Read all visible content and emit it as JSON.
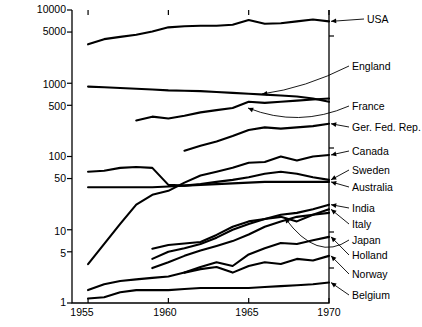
{
  "chart_data": {
    "type": "line",
    "title": "",
    "subtitle": "",
    "xlabel": "",
    "ylabel": "",
    "scale": "log-y",
    "grid": false,
    "legend_position": "right-inline-labels",
    "xlim": [
      1954,
      1970
    ],
    "ylim": [
      1,
      10000
    ],
    "x_ticks": [
      1955,
      1960,
      1965,
      1970
    ],
    "x_tick_labels": [
      "1955",
      "1960",
      "1965",
      "1970"
    ],
    "y_ticks": [
      1,
      5,
      10,
      50,
      100,
      500,
      1000,
      5000,
      10000
    ],
    "y_tick_labels": [
      "1",
      "5",
      "10",
      "50",
      "100",
      "500",
      "1000",
      "5000",
      "10000"
    ],
    "series": [
      {
        "name": "USA",
        "label": "USA",
        "x": [
          1955,
          1956,
          1957,
          1958,
          1959,
          1960,
          1961,
          1962,
          1963,
          1964,
          1965,
          1966,
          1967,
          1968,
          1969,
          1970
        ],
        "values": [
          3400,
          4000,
          4300,
          4600,
          5100,
          5800,
          6000,
          6100,
          6100,
          6300,
          7300,
          6500,
          6600,
          7000,
          7400,
          7000
        ]
      },
      {
        "name": "England",
        "label": "England",
        "x": [
          1955,
          1956,
          1957,
          1958,
          1959,
          1960,
          1961,
          1962,
          1963,
          1964,
          1965,
          1966,
          1967,
          1968,
          1969,
          1970
        ],
        "values": [
          900,
          880,
          860,
          840,
          820,
          800,
          790,
          780,
          760,
          740,
          720,
          700,
          680,
          660,
          620,
          560
        ]
      },
      {
        "name": "France",
        "label": "France",
        "x": [
          1958,
          1959,
          1960,
          1961,
          1962,
          1963,
          1964,
          1965,
          1966,
          1967,
          1968,
          1969,
          1970
        ],
        "values": [
          310,
          350,
          330,
          360,
          400,
          430,
          460,
          560,
          540,
          560,
          580,
          600,
          620
        ]
      },
      {
        "name": "Ger. Fed. Rep.",
        "label": "Ger. Fed. Rep.",
        "x": [
          1961,
          1962,
          1963,
          1964,
          1965,
          1966,
          1967,
          1968,
          1969,
          1970
        ],
        "values": [
          120,
          140,
          160,
          190,
          230,
          250,
          240,
          250,
          260,
          280
        ]
      },
      {
        "name": "Canada",
        "label": "Canada",
        "x": [
          1955,
          1957,
          1958,
          1959,
          1960,
          1961,
          1962,
          1963,
          1964,
          1965,
          1966,
          1967,
          1968,
          1969,
          1970
        ],
        "values": [
          3.4,
          12,
          22,
          30,
          34,
          44,
          55,
          62,
          70,
          82,
          84,
          100,
          88,
          100,
          105
        ]
      },
      {
        "name": "Sweden",
        "label": "Sweden",
        "x": [
          1955,
          1956,
          1957,
          1958,
          1959,
          1960,
          1961,
          1962,
          1963,
          1964,
          1965,
          1966,
          1967,
          1968,
          1969,
          1970
        ],
        "values": [
          62,
          64,
          70,
          72,
          70,
          41,
          40,
          42,
          45,
          48,
          52,
          58,
          62,
          58,
          52,
          48
        ]
      },
      {
        "name": "Australia",
        "label": "Australia",
        "x": [
          1955,
          1956,
          1957,
          1958,
          1959,
          1960,
          1961,
          1962,
          1963,
          1964,
          1965,
          1966,
          1967,
          1968,
          1969,
          1970
        ],
        "values": [
          38,
          38,
          38,
          38,
          38,
          39,
          40,
          41,
          42,
          43,
          44,
          45,
          45,
          45,
          45,
          45
        ]
      },
      {
        "name": "India",
        "label": "India",
        "x": [
          1959,
          1960,
          1961,
          1962,
          1963,
          1964,
          1965,
          1966,
          1967,
          1968,
          1969,
          1970
        ],
        "values": [
          5.5,
          6.2,
          6.5,
          6.8,
          8.5,
          11,
          13,
          14,
          16,
          17,
          19,
          22
        ]
      },
      {
        "name": "Italy",
        "label": "Italy",
        "x": [
          1959,
          1960,
          1961,
          1962,
          1963,
          1964,
          1965,
          1966,
          1967,
          1968,
          1969,
          1970
        ],
        "values": [
          4.0,
          5.0,
          5.6,
          6.4,
          7.8,
          10,
          12,
          14,
          15,
          13,
          16,
          19
        ]
      },
      {
        "name": "Japan",
        "label": "Japan",
        "x": [
          1959,
          1960,
          1961,
          1962,
          1963,
          1964,
          1965,
          1966,
          1967,
          1968,
          1969,
          1970
        ],
        "values": [
          3.0,
          3.6,
          4.4,
          5.2,
          6.0,
          7.0,
          8.6,
          11,
          13,
          15,
          16,
          17
        ]
      },
      {
        "name": "Holland",
        "label": "Holland",
        "x": [
          1961,
          1962,
          1963,
          1964,
          1965,
          1966,
          1967,
          1968,
          1969,
          1970
        ],
        "values": [
          2.6,
          3.1,
          3.6,
          3.2,
          4.6,
          5.6,
          6.6,
          6.4,
          7.2,
          8.0
        ]
      },
      {
        "name": "Norway",
        "label": "Norway",
        "x": [
          1955,
          1956,
          1957,
          1958,
          1959,
          1960,
          1961,
          1962,
          1963,
          1964,
          1965,
          1966,
          1967,
          1968,
          1969,
          1970
        ],
        "values": [
          1.5,
          1.8,
          2.0,
          2.1,
          2.2,
          2.3,
          2.6,
          2.9,
          3.1,
          2.6,
          3.2,
          3.6,
          3.4,
          4.0,
          3.8,
          4.4
        ]
      },
      {
        "name": "Belgium",
        "label": "Belgium",
        "x": [
          1955,
          1956,
          1957,
          1958,
          1959,
          1960,
          1961,
          1962,
          1963,
          1964,
          1965,
          1966,
          1967,
          1968,
          1969,
          1970
        ],
        "values": [
          1.15,
          1.2,
          1.4,
          1.5,
          1.5,
          1.5,
          1.55,
          1.6,
          1.6,
          1.6,
          1.6,
          1.65,
          1.7,
          1.75,
          1.8,
          1.9
        ]
      }
    ]
  },
  "axes": {
    "y_labels": [
      "10000",
      "5000",
      "1000",
      "500",
      "100",
      "50",
      "10",
      "5",
      "1"
    ],
    "x_labels": [
      "1955",
      "1960",
      "1965",
      "1970"
    ]
  },
  "labels": {
    "usa": "USA",
    "england": "England",
    "france": "France",
    "germany": "Ger. Fed. Rep.",
    "canada": "Canada",
    "sweden": "Sweden",
    "australia": "Australia",
    "india": "India",
    "italy": "Italy",
    "japan": "Japan",
    "holland": "Holland",
    "norway": "Norway",
    "belgium": "Belgium"
  },
  "colors": {
    "line": "#000000",
    "axis": "#000000",
    "background": "#ffffff",
    "leader": "#000000"
  }
}
